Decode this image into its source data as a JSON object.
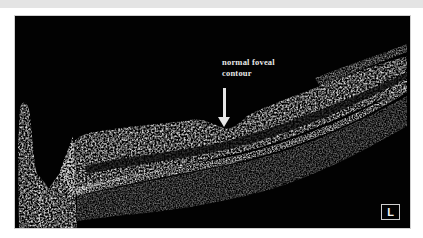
{
  "figure": {
    "type": "OCT retinal B-scan",
    "annotation": {
      "line1": "normal foveal",
      "line2": "contour"
    },
    "eye_badge": "L",
    "colors": {
      "background": "#020202",
      "tissue": "#e0e0e0",
      "annotation": "#e8e8e8"
    }
  }
}
